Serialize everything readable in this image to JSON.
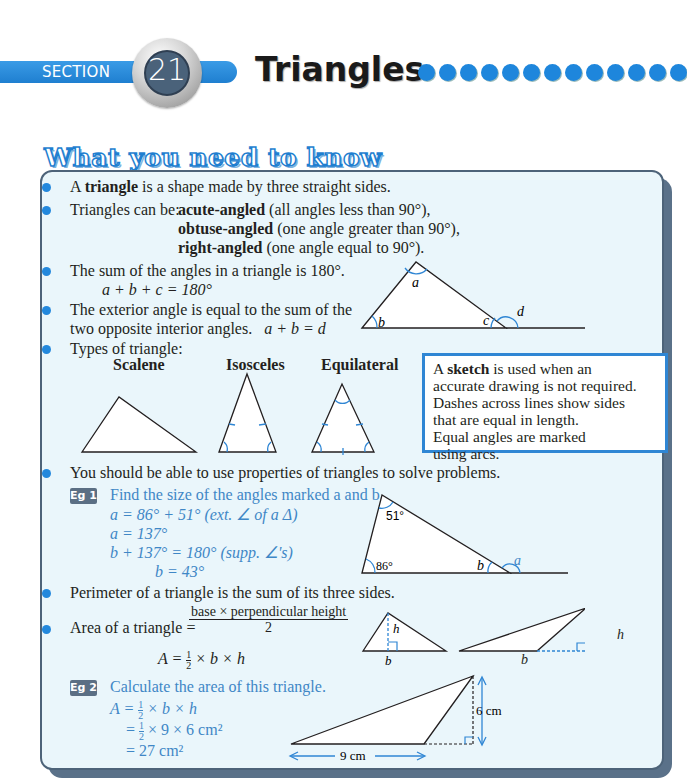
{
  "header": {
    "section_label": "SECTION",
    "section_number": "21",
    "title": "Triangles",
    "dot_count": 13,
    "accent_color": "#1e86dc"
  },
  "heading": "What you need to know",
  "bullets": {
    "definition": {
      "pre": "A ",
      "bold": "triangle",
      "post": " is a shape made by three straight sides."
    },
    "types_intro": "Triangles can be:",
    "types": [
      {
        "bold": "acute-angled",
        "post": " (all angles less than 90°),"
      },
      {
        "bold": "obtuse-angled",
        "post": " (one angle greater than 90°),"
      },
      {
        "bold": "right-angled",
        "post": " (one angle equal to 90°)."
      }
    ],
    "angle_sum": "The sum of the angles in a triangle is 180°.",
    "angle_sum_eq": "a + b + c = 180°",
    "exterior_1": "The exterior angle is equal to the sum of the",
    "exterior_2": "two opposite interior angles.",
    "exterior_eq": "a + b = d",
    "types_of_triangle": "Types of triangle:",
    "perimeter": "Perimeter of a triangle is the sum of its three sides.",
    "area_label": "Area of a triangle =",
    "area_num": "base × perpendicular height",
    "area_den": "2",
    "solve": "You should be able to use properties of triangles to solve problems."
  },
  "diagram_labels": {
    "a": "a",
    "b": "b",
    "c": "c",
    "d": "d",
    "h": "h"
  },
  "triangle_types": [
    "Scalene",
    "Isosceles",
    "Equilateral"
  ],
  "sketch_box": {
    "pre": "A ",
    "bold": "sketch",
    "lines": [
      " is used when an",
      "accurate drawing is not required.",
      "Dashes across lines show sides",
      "that are equal in length.",
      "Equal angles are marked",
      "using arcs."
    ]
  },
  "eg1": {
    "tag": "Eg 1",
    "question": "Find the size of the angles marked a and b.",
    "lines": [
      "a = 86° + 51°   (ext. ∠ of a Δ)",
      "a = 137°",
      "b + 137° = 180°   (supp. ∠'s)",
      "b = 43°"
    ],
    "angle_top": "51°",
    "angle_left": "86°"
  },
  "area_formula": {
    "lhs": "A = ",
    "half_num": "1",
    "half_den": "2",
    "rhs": " × b × h"
  },
  "eg2": {
    "tag": "Eg 2",
    "question": "Calculate the area of this triangle.",
    "line1_pre": "A = ",
    "line1_post": " × b × h",
    "line2_pre": "= ",
    "line2_post": " × 9 × 6 cm²",
    "line3": "= 27 cm²",
    "base_label": "9 cm",
    "height_label": "6 cm"
  }
}
